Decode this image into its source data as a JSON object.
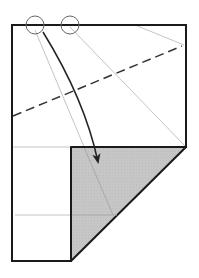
{
  "diagram": {
    "type": "origami-fold-step",
    "colors": {
      "background": "#ffffff",
      "outline": "#1a1a1a",
      "reference_line": "#c4c4c4",
      "valley_fold": "#333333",
      "flap_fill": "#c6c6c6",
      "circle": "#666666",
      "arrow": "#222222"
    },
    "paper": {
      "x1": 12,
      "y1": 25,
      "x2": 186,
      "y2": 261
    },
    "flap": {
      "points": "71,147 186,147 71,261",
      "label": "folded-flap-shaded"
    },
    "valley_fold_line": {
      "x1": 13,
      "y1": 116,
      "x2": 182,
      "y2": 46
    },
    "reference_lines": [
      {
        "x1": 35,
        "y1": 30,
        "x2": 113,
        "y2": 215
      },
      {
        "x1": 70,
        "y1": 27,
        "x2": 186,
        "y2": 147
      },
      {
        "x1": 135,
        "y1": 25,
        "x2": 184,
        "y2": 45
      },
      {
        "x1": 12,
        "y1": 147,
        "x2": 71,
        "y2": 147
      },
      {
        "x1": 15,
        "y1": 215,
        "x2": 113,
        "y2": 215
      }
    ],
    "reference_points": [
      {
        "cx": 35,
        "cy": 25,
        "r": 9,
        "label": "circle-point-a"
      },
      {
        "cx": 70,
        "cy": 25,
        "r": 9,
        "label": "circle-point-b"
      }
    ],
    "arrow": {
      "path": "M43,32 Q85,100 98,160",
      "tip": [
        99,
        166
      ]
    }
  }
}
